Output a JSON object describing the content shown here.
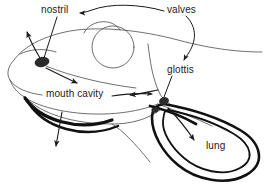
{
  "figure": {
    "labels": {
      "nostril": "nostril",
      "valves": "valves",
      "mouth_cavity": "mouth cavity",
      "glottis": "glottis",
      "lung": "lung"
    },
    "colors": {
      "outline": "#3a3a3a",
      "thick_stroke": "#111111",
      "label_text": "#1a1a1a",
      "marker_fill": "#2b2b2b",
      "background": "#ffffff"
    },
    "parts": [
      {
        "name": "nostril",
        "kind": "marker",
        "x": 42,
        "y": 62
      },
      {
        "name": "glottis",
        "kind": "marker",
        "x": 163,
        "y": 100
      },
      {
        "name": "eye",
        "kind": "circle",
        "x": 113,
        "y": 47,
        "r": 21
      },
      {
        "name": "eyelid-arc",
        "kind": "arc",
        "x": 98,
        "y": 27
      },
      {
        "name": "lung",
        "kind": "loop",
        "x": 215,
        "y": 143
      },
      {
        "name": "mouth-cavity-floor",
        "kind": "thick-curve"
      },
      {
        "name": "head-outline",
        "kind": "outline"
      }
    ],
    "leaders": [
      {
        "from": "valves",
        "to": "nostril",
        "style": "arrow"
      },
      {
        "from": "valves",
        "to": "glottis",
        "style": "arrow"
      },
      {
        "from": "nostril",
        "to": "nostril-marker",
        "style": "line"
      },
      {
        "from": "glottis",
        "to": "glottis-marker",
        "style": "line"
      }
    ],
    "flow_arrows": [
      {
        "name": "air-out-of-nostril",
        "direction": "up-left"
      },
      {
        "name": "air-into-mouth-cavity",
        "direction": "down-right"
      },
      {
        "name": "air-toward-glottis",
        "direction": "right"
      },
      {
        "name": "air-back-from-glottis",
        "direction": "left"
      },
      {
        "name": "air-into-lung",
        "direction": "down-right"
      },
      {
        "name": "mouth-floor-depression",
        "direction": "down"
      }
    ]
  }
}
